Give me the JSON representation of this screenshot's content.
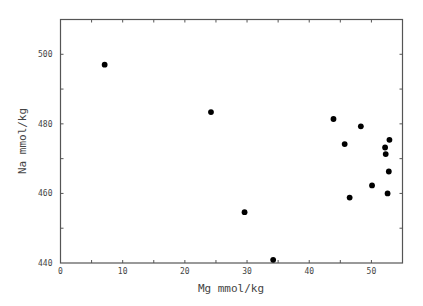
{
  "chart_data": {
    "type": "scatter",
    "title": "",
    "xlabel": "Mg mmol/kg",
    "ylabel": "Na mmol/kg",
    "xlim": [
      0,
      55
    ],
    "ylim": [
      440,
      510
    ],
    "x_ticks": [
      0,
      10,
      20,
      30,
      40,
      50
    ],
    "x_tick_labels": [
      "0",
      "10",
      "20",
      "30",
      "40",
      "50"
    ],
    "x_minor_ticks": [
      5,
      15,
      25,
      35,
      45
    ],
    "y_ticks": [
      440,
      460,
      480,
      500
    ],
    "y_tick_labels": [
      "440",
      "460",
      "480",
      "500"
    ],
    "y_minor_ticks": [
      450,
      470,
      490
    ],
    "grid": false,
    "legend": null,
    "series": [
      {
        "name": "samples",
        "marker": "filled-circle",
        "color": "#000000",
        "points": [
          {
            "x": 7.1,
            "y": 497.0
          },
          {
            "x": 24.2,
            "y": 483.4
          },
          {
            "x": 29.6,
            "y": 454.6
          },
          {
            "x": 34.2,
            "y": 440.9
          },
          {
            "x": 43.9,
            "y": 481.4
          },
          {
            "x": 48.3,
            "y": 479.3
          },
          {
            "x": 45.7,
            "y": 474.2
          },
          {
            "x": 52.9,
            "y": 475.4
          },
          {
            "x": 52.2,
            "y": 473.2
          },
          {
            "x": 52.3,
            "y": 471.3
          },
          {
            "x": 52.8,
            "y": 466.3
          },
          {
            "x": 50.1,
            "y": 462.3
          },
          {
            "x": 52.6,
            "y": 460.0
          },
          {
            "x": 46.5,
            "y": 458.8
          }
        ]
      }
    ]
  }
}
